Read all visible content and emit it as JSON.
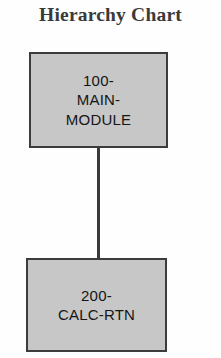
{
  "chart_data": {
    "type": "diagram",
    "title": "Hierarchy Chart",
    "nodes": [
      {
        "id": "main",
        "label": "100-\nMAIN-\nMODULE",
        "level": 0
      },
      {
        "id": "calc",
        "label": "200-\nCALC-RTN",
        "level": 1
      }
    ],
    "edges": [
      {
        "from": "main",
        "to": "calc",
        "style": "vertical-line"
      }
    ],
    "colors": {
      "node_fill": "#c7c7c7",
      "node_border": "#3c3c3c",
      "connector": "#3a3a3a",
      "title_text": "#3a3a3a",
      "node_text": "#151515",
      "background": "#fefefe"
    }
  },
  "title": "Hierarchy Chart",
  "nodes": {
    "main": "100-\nMAIN-\nMODULE",
    "calc": "200-\nCALC-RTN"
  }
}
